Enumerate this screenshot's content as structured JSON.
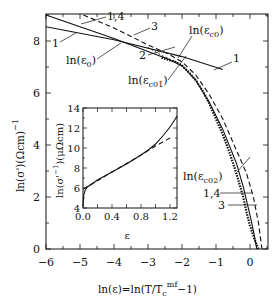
{
  "chart_data": [
    {
      "id": "main",
      "type": "line",
      "title": "",
      "xlabel": "ln(ε)=ln(T/Tc^mf −1)",
      "ylabel": "ln(σ')(Ωcm)^-1",
      "xlim": [
        -6,
        0.5
      ],
      "ylim": [
        0,
        9.05
      ],
      "xticks": [
        -6,
        -5,
        -4,
        -3,
        -2,
        -1,
        0
      ],
      "yticks": [
        0,
        2,
        4,
        6,
        8
      ],
      "grid": false,
      "legend": "none (curves labeled by annotations)",
      "series": [
        {
          "name": "data",
          "style": "dotted-thick",
          "x": [
            -2.6,
            -2.2,
            -2.0,
            -1.8,
            -1.6,
            -1.4,
            -1.2,
            -1.0,
            -0.8,
            -0.6,
            -0.4,
            -0.2,
            -0.1,
            0.0,
            0.1,
            0.2,
            0.25
          ],
          "y": [
            7.35,
            7.2,
            7.05,
            6.8,
            6.5,
            6.1,
            5.6,
            5.0,
            4.4,
            3.7,
            2.9,
            2.0,
            1.4,
            0.9,
            0.5,
            0.15,
            0.0
          ]
        },
        {
          "name": "1,4",
          "style": "solid",
          "x": [
            -6.0,
            -5.0,
            -4.0,
            -3.0,
            -2.4,
            -2.0,
            -1.6,
            -1.2,
            -0.8,
            -0.4,
            -0.2,
            0.0,
            0.1,
            0.2
          ],
          "y": [
            9.0,
            8.55,
            8.1,
            7.6,
            7.3,
            7.05,
            6.5,
            5.65,
            4.6,
            3.3,
            2.4,
            1.3,
            0.7,
            0.0
          ]
        },
        {
          "name": "1 (low-T asymptote)",
          "style": "solid",
          "x": [
            -6.0,
            -4.0,
            -2.0,
            -0.8
          ],
          "y": [
            8.55,
            8.05,
            7.4,
            6.9
          ]
        },
        {
          "name": "3",
          "style": "dashed",
          "x": [
            -4.9,
            -4.0,
            -3.0,
            -2.4,
            -2.0,
            -1.6,
            -1.2,
            -0.8,
            -0.4,
            -0.1,
            0.1,
            0.25,
            0.35
          ],
          "y": [
            9.0,
            8.5,
            7.85,
            7.5,
            7.2,
            6.7,
            5.95,
            5.0,
            3.8,
            2.9,
            2.0,
            1.0,
            0.0
          ]
        },
        {
          "name": "2",
          "style": "dashed-fine",
          "x": [
            -3.0,
            -2.6,
            -2.2,
            -2.0
          ],
          "y": [
            7.75,
            7.45,
            7.2,
            7.05
          ]
        }
      ],
      "annotations": [
        {
          "text": "1,4",
          "at": [
            -4.3,
            8.5
          ]
        },
        {
          "text": "1",
          "at": [
            -5.8,
            8.0
          ]
        },
        {
          "text": "ln(ε0)",
          "at": [
            -4.9,
            7.5
          ]
        },
        {
          "text": "3",
          "at": [
            -3.0,
            8.45
          ]
        },
        {
          "text": "2",
          "at": [
            -2.8,
            7.2
          ]
        },
        {
          "text": "ln(εc0)",
          "at": [
            -1.7,
            8.2
          ]
        },
        {
          "text": "ln(εc01)",
          "at": [
            -2.8,
            6.8
          ]
        },
        {
          "text": "1",
          "at": [
            -0.6,
            7.65
          ]
        },
        {
          "text": "ln(εc02)",
          "at": [
            -1.4,
            2.8
          ]
        },
        {
          "text": "1,4",
          "at": [
            -1.4,
            2.0
          ]
        },
        {
          "text": "3",
          "at": [
            -1.0,
            1.1
          ]
        }
      ]
    },
    {
      "id": "inset",
      "type": "line",
      "title": "",
      "xlabel": "ε",
      "ylabel": "ln(σ'^-1)(μΩcm)",
      "xlim": [
        0.0,
        1.3
      ],
      "ylim": [
        4,
        14
      ],
      "xticks": [
        0.0,
        0.4,
        0.8,
        1.2
      ],
      "yticks": [
        4,
        6,
        8,
        10,
        12,
        14
      ],
      "grid": false,
      "series": [
        {
          "name": "measured",
          "style": "solid",
          "x": [
            0.0,
            0.01,
            0.03,
            0.06,
            0.1,
            0.2,
            0.4,
            0.6,
            0.8,
            0.9,
            1.0,
            1.1,
            1.2,
            1.3
          ],
          "y": [
            4.2,
            5.3,
            5.8,
            6.1,
            6.3,
            6.8,
            7.6,
            8.4,
            9.3,
            9.8,
            10.4,
            11.2,
            12.1,
            13.2
          ]
        },
        {
          "name": "fit",
          "style": "dashed",
          "x": [
            0.0,
            0.05,
            0.1,
            0.4,
            0.8,
            0.9,
            1.0,
            1.1,
            1.2
          ],
          "y": [
            5.9,
            6.1,
            6.3,
            7.6,
            9.3,
            9.75,
            10.2,
            10.6,
            11.0
          ]
        }
      ]
    }
  ],
  "labels": {
    "x_axis_title_main": "ln(ε)=ln(T/T",
    "x_axis_title_sub": "c",
    "x_axis_title_sup": "mf",
    "x_axis_title_tail": "−1)",
    "y_axis_title_main": "ln(σ')(Ωcm)",
    "y_axis_title_sup": "−1",
    "inset_x_title": "ε",
    "inset_y_title": "ln(σ'",
    "inset_y_sup": "−1",
    "inset_y_tail": ")(μΩcm)",
    "ann_14_top": "1,4",
    "ann_1_top": "1",
    "ann_ln_e0": "ln(ε",
    "ann_ln_e0_sub": "0",
    "ann_3_top": "3",
    "ann_2": "2",
    "ann_ln_ec0": "ln(ε",
    "ann_ln_ec0_sub": "c0",
    "ann_ln_ec01": "ln(ε",
    "ann_ln_ec01_sub": "c01",
    "ann_1_right": "1",
    "ann_ln_ec02": "ln(ε",
    "ann_ln_ec02_sub": "c02",
    "ann_14_bottom": "1,4",
    "ann_3_bottom": "3",
    "close_paren": ")"
  },
  "ticks": {
    "x": [
      "−6",
      "−5",
      "−4",
      "−3",
      "−2",
      "−1",
      "0"
    ],
    "y": [
      "0",
      "2",
      "4",
      "6",
      "8"
    ],
    "inset_x": [
      "0.0",
      "0.4",
      "0.8",
      "1.2"
    ],
    "inset_y": [
      "4",
      "6",
      "8",
      "10",
      "12",
      "14"
    ]
  },
  "colors": {
    "ink": "#111111",
    "background": "#ffffff"
  }
}
